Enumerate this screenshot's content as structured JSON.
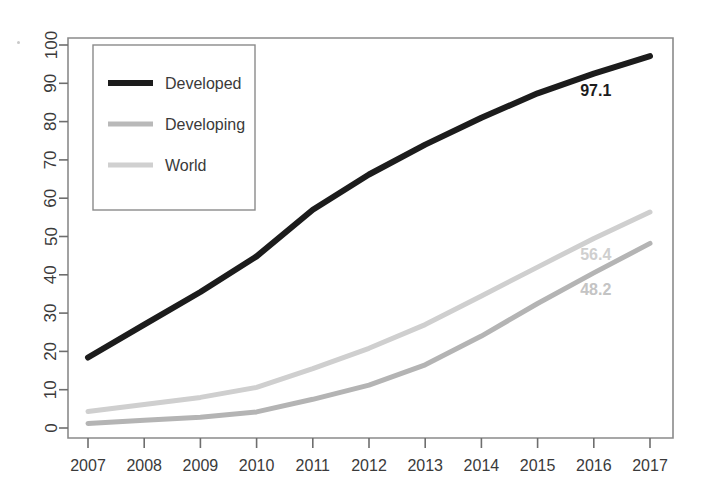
{
  "chart_data": {
    "type": "line",
    "title": "",
    "subtitle": "",
    "xlabel": "",
    "ylabel": "",
    "x": [
      2007,
      2008,
      2009,
      2010,
      2011,
      2012,
      2013,
      2014,
      2015,
      2016,
      2017
    ],
    "categories": [
      "2007",
      "2008",
      "2009",
      "2010",
      "2011",
      "2012",
      "2013",
      "2014",
      "2015",
      "2016",
      "2017"
    ],
    "series": [
      {
        "name": "Developed",
        "color": "#1c1c1c",
        "width": 6,
        "values": [
          18.4,
          27.0,
          35.5,
          44.8,
          57.0,
          66.2,
          74.0,
          81.0,
          87.4,
          92.5,
          97.1
        ],
        "end_label": "97.1"
      },
      {
        "name": "Developing",
        "color": "#b4b4b4",
        "width": 5,
        "values": [
          1.2,
          2.0,
          2.8,
          4.2,
          7.5,
          11.2,
          16.5,
          24.0,
          32.5,
          40.5,
          48.2
        ],
        "end_label": "48.2"
      },
      {
        "name": "World",
        "color": "#cfcfcf",
        "width": 5,
        "values": [
          4.3,
          6.1,
          8.0,
          10.6,
          15.5,
          20.8,
          27.0,
          34.5,
          42.0,
          49.5,
          56.4
        ],
        "end_label": "56.4"
      }
    ],
    "ylim": [
      0,
      100
    ],
    "yticks": [
      0,
      10,
      20,
      30,
      40,
      50,
      60,
      70,
      80,
      90,
      100
    ],
    "ytick_labels": [
      "0",
      "10",
      "20",
      "30",
      "40",
      "50",
      "60",
      "70",
      "80",
      "90",
      "100"
    ],
    "xlim": [
      2007,
      2017
    ],
    "grid": false,
    "legend_position": "top-left",
    "annotations": [
      {
        "text": "97.1",
        "series": "Developed",
        "x": 2016,
        "y": 92.5,
        "color": "#1c1c1c"
      },
      {
        "text": "56.4",
        "series": "World",
        "x": 2016,
        "y": 49.5,
        "color": "#cfcfcf"
      },
      {
        "text": "48.2",
        "series": "Developing",
        "x": 2016,
        "y": 40.5,
        "color": "#c4c4c4"
      }
    ]
  },
  "legend": {
    "entries": [
      {
        "label": "Developed",
        "color": "#1c1c1c",
        "width": 6
      },
      {
        "label": "Developing",
        "color": "#b9b9b9",
        "width": 5
      },
      {
        "label": "World",
        "color": "#d0d0d0",
        "width": 5
      }
    ]
  },
  "axes": {
    "y_tick_labels": [
      "0",
      "10",
      "20",
      "30",
      "40",
      "50",
      "60",
      "70",
      "80",
      "90",
      "100"
    ],
    "x_tick_labels": [
      "2007",
      "2008",
      "2009",
      "2010",
      "2011",
      "2012",
      "2013",
      "2014",
      "2015",
      "2016",
      "2017"
    ]
  },
  "colors": {
    "frame": "#8a8a8a",
    "tick": "#6e6e6e",
    "text": "#3a3a3a",
    "background": "#ffffff"
  }
}
